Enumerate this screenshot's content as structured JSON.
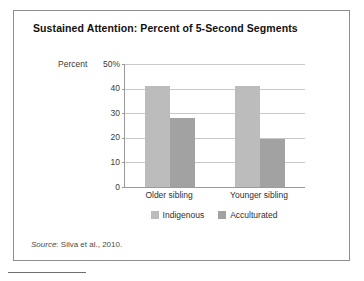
{
  "figure": {
    "title": "Sustained Attention: Percent of 5-Second Segments",
    "source_prefix": "Source",
    "source_text": ": Silva et al., 2010."
  },
  "chart_data": {
    "type": "bar",
    "title": "Sustained Attention: Percent of 5-Second Segments",
    "xlabel": "",
    "ylabel": "Percent",
    "categories": [
      "Older sibling",
      "Younger sibling"
    ],
    "series": [
      {
        "name": "Indigenous",
        "color": "#bcbcbc",
        "values": [
          41,
          41
        ]
      },
      {
        "name": "Acculturated",
        "color": "#a2a2a2",
        "values": [
          28,
          19.5
        ]
      }
    ],
    "ylim": [
      0,
      50
    ],
    "yticks": [
      0,
      10,
      20,
      30,
      40,
      50
    ],
    "ytick_labels": [
      "0",
      "10",
      "20",
      "30",
      "40",
      "50%"
    ],
    "grid": true,
    "legend_position": "bottom"
  },
  "axis": {
    "y_title": "Percent",
    "ticks": [
      {
        "value": 50,
        "label": "50%"
      },
      {
        "value": 40,
        "label": "40"
      },
      {
        "value": 30,
        "label": "30"
      },
      {
        "value": 20,
        "label": "20"
      },
      {
        "value": 10,
        "label": "10"
      },
      {
        "value": 0,
        "label": "0"
      }
    ]
  },
  "legend": {
    "items": [
      {
        "label": "Indigenous",
        "color": "#bcbcbc"
      },
      {
        "label": "Acculturated",
        "color": "#a2a2a2"
      }
    ]
  }
}
